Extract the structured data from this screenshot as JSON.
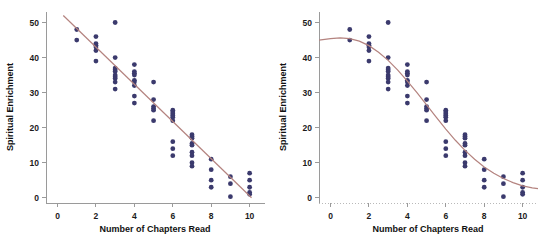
{
  "figure": {
    "background": "#ffffff",
    "width": 546,
    "height": 245,
    "panel_count": 2
  },
  "colors": {
    "point": "#3b3a6d",
    "fit_curve": "#b4837f",
    "axis": "#9a9a9a",
    "text": "#111111"
  },
  "chart_data": [
    {
      "type": "scatter",
      "panel": "left",
      "title": "",
      "xlabel": "Number of Chapters Read",
      "ylabel": "Spiritual Enrichment",
      "xlim": [
        -0.6,
        10.8
      ],
      "ylim": [
        -1.5,
        53
      ],
      "xticks": [
        0,
        2,
        4,
        6,
        8,
        10
      ],
      "xticklabels": [
        "0",
        "2",
        "4",
        "6",
        "8",
        "10"
      ],
      "yticks": [
        0,
        10,
        20,
        30,
        40,
        50
      ],
      "yticklabels": [
        "0",
        "10",
        "20",
        "30",
        "40",
        "50"
      ],
      "grid": false,
      "legend": "none",
      "x": [
        1,
        1,
        2,
        2,
        2,
        2,
        2,
        2,
        3,
        3,
        3,
        3,
        3,
        3,
        3,
        3,
        3,
        3,
        4,
        4,
        4,
        4,
        4,
        4,
        4,
        4,
        4,
        5,
        5,
        5,
        5,
        5,
        5,
        6,
        6,
        6,
        6,
        6,
        6,
        6,
        6,
        6,
        7,
        7,
        7,
        7,
        7,
        7,
        7,
        7,
        7,
        8,
        8,
        8,
        8,
        9,
        9,
        9,
        10,
        10,
        10,
        10,
        10
      ],
      "y": [
        48,
        45,
        46,
        44,
        43.5,
        43,
        42,
        39,
        50,
        40,
        37,
        36.5,
        36,
        35,
        34.5,
        34,
        33,
        31,
        38,
        36,
        35.5,
        35,
        33.5,
        33,
        32,
        29,
        27,
        33,
        28,
        26,
        25.5,
        25,
        22,
        25,
        24.5,
        24,
        23.5,
        23,
        22,
        16,
        14,
        12,
        18,
        17.5,
        17,
        15.5,
        15,
        13,
        12,
        10,
        9,
        11,
        8,
        5,
        3,
        6,
        4,
        0.3,
        7,
        5,
        3,
        1.5,
        1
      ],
      "fit": {
        "model": "linear",
        "label": "linear regression line",
        "x_start": 0.3,
        "x_end": 10.1,
        "y_start": 52.0,
        "y_end": 0.0,
        "slope": -5.31,
        "intercept": 53.6
      }
    },
    {
      "type": "scatter",
      "panel": "right",
      "title": "",
      "xlabel": "Number of Chapters Read",
      "ylabel": "Spiritual Enrichment",
      "xlim": [
        -0.6,
        10.8
      ],
      "ylim": [
        -1.5,
        53
      ],
      "xticks": [
        0,
        2,
        4,
        6,
        8,
        10
      ],
      "xticklabels": [
        "0",
        "2",
        "4",
        "6",
        "8",
        "10"
      ],
      "yticks": [
        0,
        10,
        20,
        30,
        40,
        50
      ],
      "yticklabels": [
        "0",
        "10",
        "20",
        "30",
        "40",
        "50"
      ],
      "grid": false,
      "legend": "none",
      "x": [
        1,
        1,
        2,
        2,
        2,
        2,
        2,
        2,
        3,
        3,
        3,
        3,
        3,
        3,
        3,
        3,
        3,
        3,
        4,
        4,
        4,
        4,
        4,
        4,
        4,
        4,
        4,
        5,
        5,
        5,
        5,
        5,
        5,
        6,
        6,
        6,
        6,
        6,
        6,
        6,
        6,
        6,
        7,
        7,
        7,
        7,
        7,
        7,
        7,
        7,
        7,
        8,
        8,
        8,
        8,
        9,
        9,
        9,
        10,
        10,
        10,
        10,
        10
      ],
      "y": [
        48,
        45,
        46,
        44,
        43.5,
        43,
        42,
        39,
        50,
        40,
        37,
        36.5,
        36,
        35,
        34.5,
        34,
        33,
        31,
        38,
        36,
        35.5,
        35,
        33.5,
        33,
        32,
        29,
        27,
        33,
        28,
        26,
        25.5,
        25,
        22,
        25,
        24.5,
        24,
        23.5,
        23,
        22,
        16,
        14,
        12,
        18,
        17.5,
        17,
        15.5,
        15,
        13,
        12,
        10,
        9,
        11,
        8,
        5,
        3,
        6,
        4,
        0.3,
        7,
        5,
        3,
        1.5,
        1
      ],
      "fit": {
        "model": "cubic",
        "label": "cubic / sigmoid smooth fit",
        "x_start": -0.6,
        "x_end": 10.8,
        "curve_points_x": [
          -0.6,
          0,
          0.5,
          1,
          1.5,
          2,
          2.5,
          3,
          3.5,
          4,
          4.5,
          5,
          5.5,
          6,
          6.5,
          7,
          7.5,
          8,
          8.5,
          9,
          9.5,
          10,
          10.5,
          10.8
        ],
        "curve_points_y": [
          45.0,
          45.4,
          45.6,
          45.4,
          44.7,
          43.4,
          41.5,
          39.2,
          36.4,
          33.3,
          30.0,
          26.5,
          23.0,
          19.6,
          16.4,
          13.5,
          11.0,
          8.8,
          7.0,
          5.5,
          4.3,
          3.4,
          2.8,
          2.6
        ],
        "plateau_high": 45.5,
        "plateau_low": 2.6,
        "inflection_x": 5.0
      }
    }
  ],
  "panels": [
    {
      "name": "left-panel",
      "xlabel": "Number of Chapters Read",
      "ylabel": "Spiritual Enrichment"
    },
    {
      "name": "right-panel",
      "xlabel": "Number of Chapters Read",
      "ylabel": "Spiritual Enrichment"
    }
  ]
}
